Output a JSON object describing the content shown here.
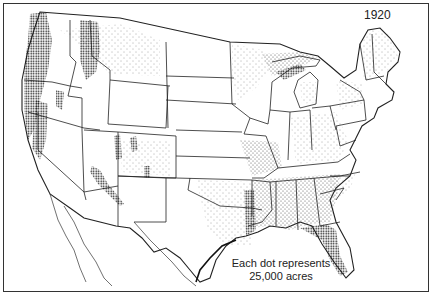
{
  "map": {
    "title_year": "1920",
    "legend": {
      "line1": "Each dot represents",
      "line2": "25,000 acres"
    },
    "subject": "Dot-density map of the conterminous United States with state boundaries",
    "colors": {
      "ink": "#222222",
      "background": "#ffffff",
      "frame": "#333333"
    },
    "dense_regions": [
      "Pacific Northwest coast (Washington, Oregon)",
      "Northern Idaho / western Montana Rockies",
      "Northern California coast and Sierra Nevada",
      "Colorado Rockies",
      "Arizona Mogollon Rim",
      "Northern New Mexico",
      "Lower Mississippi valley (Arkansas, Louisiana, Mississippi)",
      "Gulf coast and Florida"
    ],
    "moderate_regions": [
      "Northern Minnesota, Wisconsin, Michigan",
      "Maine, New Hampshire, New York",
      "Appalachians",
      "Southeastern states",
      "East Texas and Oklahoma"
    ]
  }
}
